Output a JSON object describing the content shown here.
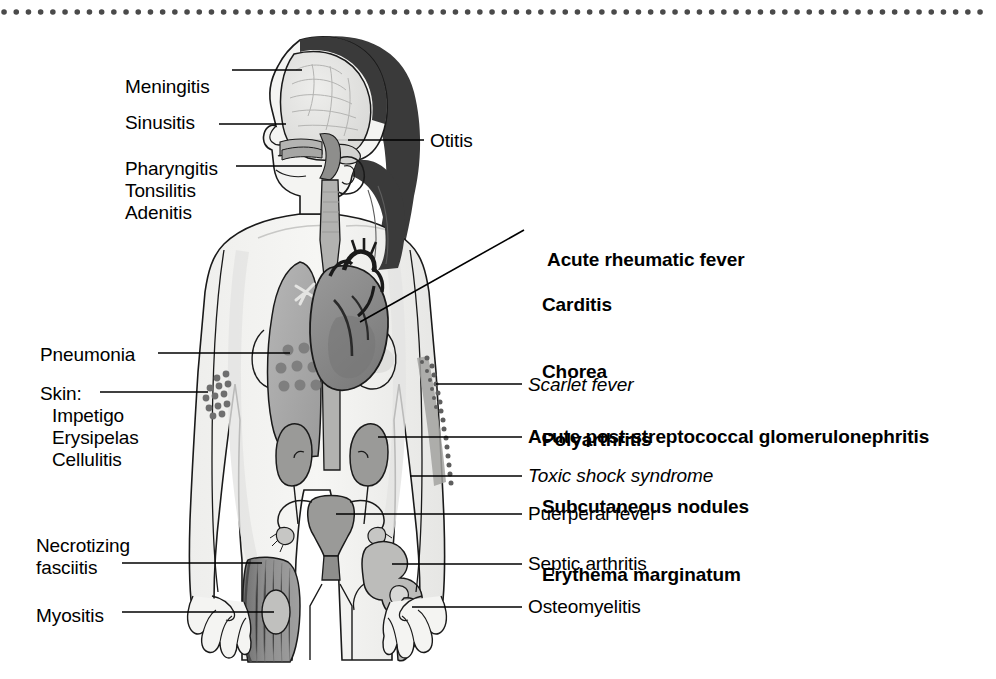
{
  "figure": {
    "border": {
      "style": "dotted",
      "color": "#4a4a4a",
      "position": "top"
    }
  },
  "colors": {
    "ink": "#000000",
    "outline": "#1a1a1a",
    "body_fill": "#f2f2f0",
    "body_shade": "#dcdcda",
    "hair": "#3a3a3a",
    "brain": "#e2e2e0",
    "lung": "#a9a9a9",
    "heart": "#8b8b8b",
    "heart_dark": "#6e6e6e",
    "kidney": "#9a9a9a",
    "uterus": "#9a9a9a",
    "muscle": "#8f8f8f",
    "bone": "#bcbcbc",
    "airway": "#b4b4b4",
    "rash_dot": "#6f6f6f",
    "consolidation": "#7a7a7a",
    "leader": "#000000"
  },
  "labels_left": [
    {
      "id": "meningitis",
      "text": "Meningitis",
      "x": 125,
      "y": 76,
      "style": "plain"
    },
    {
      "id": "sinusitis",
      "text": "Sinusitis",
      "x": 125,
      "y": 112,
      "style": "plain"
    },
    {
      "id": "pharyngitis",
      "text": "Pharyngitis",
      "x": 125,
      "y": 158,
      "style": "plain"
    },
    {
      "id": "tonsilitis",
      "text": "Tonsilitis",
      "x": 125,
      "y": 180,
      "style": "plain"
    },
    {
      "id": "adenitis",
      "text": "Adenitis",
      "x": 125,
      "y": 202,
      "style": "plain"
    },
    {
      "id": "pneumonia",
      "text": "Pneumonia",
      "x": 40,
      "y": 344,
      "style": "plain"
    },
    {
      "id": "skin",
      "text": "Skin:",
      "x": 40,
      "y": 383,
      "style": "plain"
    },
    {
      "id": "impetigo",
      "text": "Impetigo",
      "x": 52,
      "y": 405,
      "style": "plain"
    },
    {
      "id": "erysipelas",
      "text": "Erysipelas",
      "x": 52,
      "y": 427,
      "style": "plain"
    },
    {
      "id": "cellulitis",
      "text": "Cellulitis",
      "x": 52,
      "y": 449,
      "style": "plain"
    },
    {
      "id": "necrotizing",
      "text": "Necrotizing",
      "x": 36,
      "y": 535,
      "style": "plain"
    },
    {
      "id": "fasciitis",
      "text": "fasciitis",
      "x": 36,
      "y": 557,
      "style": "plain"
    },
    {
      "id": "myosistis",
      "text": "Myositis",
      "x": 36,
      "y": 605,
      "style": "plain"
    }
  ],
  "labels_right": [
    {
      "id": "otitis",
      "text": "Otitis",
      "x": 430,
      "y": 130,
      "style": "plain"
    },
    {
      "id": "scarlet-fever",
      "text": "Scarlet fever",
      "x": 528,
      "y": 390,
      "style": "italic"
    },
    {
      "id": "agn",
      "text": "Acute post-streptococcal glomerulonephritis",
      "x": 528,
      "y": 426,
      "style": "bold"
    },
    {
      "id": "tss",
      "text": "Toxic shock syndrome",
      "x": 528,
      "y": 465,
      "style": "italic"
    },
    {
      "id": "puerperal-fever",
      "text": "Puerperal fever",
      "x": 528,
      "y": 505,
      "style": "plain"
    },
    {
      "id": "septic-arthritis",
      "text": "Septic arthritis",
      "x": 528,
      "y": 554,
      "style": "plain"
    },
    {
      "id": "osteomyelitis",
      "text": "Osteomyelitis",
      "x": 528,
      "y": 597,
      "style": "plain"
    }
  ],
  "rheumatic_block": {
    "id": "acute-rheumatic-fever",
    "x": 527,
    "y": 226,
    "heading": "Acute rheumatic fever",
    "items": [
      "Carditis",
      "Chorea",
      "Polyarthritis",
      "Subcutaneous nodules",
      "Erythema marginatum"
    ]
  },
  "anatomy_parts": [
    "brain",
    "skull",
    "hair",
    "face-profile",
    "ear",
    "oral-cavity",
    "pharynx",
    "trachea",
    "esophagus",
    "lung",
    "heart",
    "aorta",
    "kidney-left",
    "kidney-right",
    "ureter",
    "uterus",
    "fallopian-tube",
    "ovary",
    "vagina",
    "thigh-muscle",
    "femur",
    "hip-bone",
    "hand",
    "skin-rash-arm",
    "lung-consolidation",
    "scarlet-fever-rash"
  ]
}
